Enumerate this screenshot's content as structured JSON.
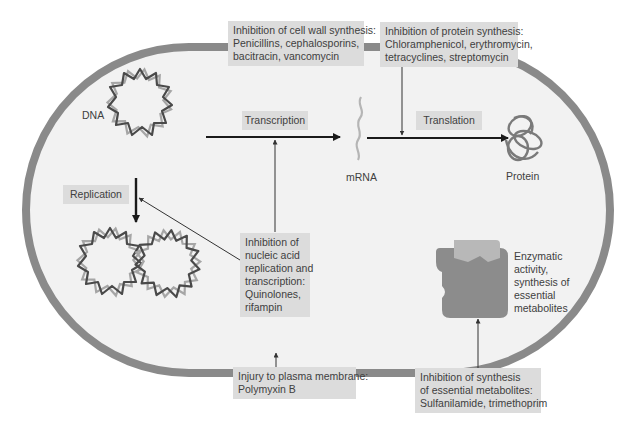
{
  "colors": {
    "cell_wall": "#8a8a8a",
    "cytoplasm": "#f2f2f2",
    "label_box": "#dcdcdc",
    "arrow": "#1a1a1a",
    "dna_dark": "#4a4a4a",
    "dna_light": "#a6a6a6",
    "mrna": "#b5b5b5",
    "protein": "#7a7a7a",
    "enzyme_dark": "#8c8c8c",
    "enzyme_light": "#b8b8b8"
  },
  "cell": {
    "molecules": {
      "dna": "DNA",
      "mrna": "mRNA",
      "protein": "Protein",
      "enzyme": [
        "Enzymatic",
        "activity,",
        "synthesis of",
        "essential",
        "metabolites"
      ]
    },
    "processes": {
      "transcription": "Transcription",
      "translation": "Translation",
      "replication": "Replication"
    }
  },
  "targets": {
    "cell_wall": [
      "Inhibition of cell wall synthesis:",
      "Penicillins, cephalosporins,",
      "bacitracin, vancomycin"
    ],
    "protein_synthesis": [
      "Inhibition of protein synthesis:",
      "Chloramphenicol, erythromycin,",
      "tetracyclines, streptomycin"
    ],
    "nucleic_acid": [
      "Inhibition of",
      "nucleic acid",
      "replication and",
      "transcription:",
      "Quinolones,",
      "rifampin"
    ],
    "plasma_membrane": [
      "Injury to plasma membrane:",
      "Polymyxin B"
    ],
    "metabolites": [
      "Inhibition of synthesis",
      "of essential metabolites:",
      "Sulfanilamide, trimethoprim"
    ]
  }
}
